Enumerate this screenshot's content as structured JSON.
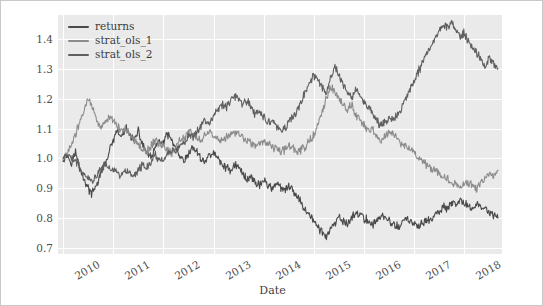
{
  "chart_data": {
    "type": "line",
    "title": "",
    "xlabel": "Date",
    "ylabel": "",
    "grid": true,
    "legend_position": "upper-left",
    "xlim": [
      2009.9,
      2018.75
    ],
    "ylim": [
      0.68,
      1.48
    ],
    "yticks": [
      "1.4",
      "1.3",
      "1.2",
      "1.1",
      "1.0",
      "0.9",
      "0.8",
      "0.7"
    ],
    "ytick_values": [
      1.4,
      1.3,
      1.2,
      1.1,
      1.0,
      0.9,
      0.8,
      0.7
    ],
    "xticks": [
      "2010",
      "2011",
      "2012",
      "2013",
      "2014",
      "2015",
      "2016",
      "2017",
      "2018"
    ],
    "xtick_values": [
      2010,
      2011,
      2012,
      2013,
      2014,
      2015,
      2016,
      2017,
      2018
    ],
    "colors": {
      "returns": "#4a4a4a",
      "strat_ols_1": "#8c8c8c",
      "strat_ols_2": "#5f5f5f",
      "plot_background": "#eaeaea",
      "gridline": "#ffffff",
      "figure_background": "#ffffff",
      "figure_border": "#c9c9c9",
      "tick_text": "#4d4d4d"
    },
    "x": [
      2010.0,
      2010.08,
      2010.17,
      2010.25,
      2010.33,
      2010.42,
      2010.5,
      2010.58,
      2010.67,
      2010.75,
      2010.83,
      2010.92,
      2011.0,
      2011.08,
      2011.17,
      2011.25,
      2011.33,
      2011.42,
      2011.5,
      2011.58,
      2011.67,
      2011.75,
      2011.83,
      2011.92,
      2012.0,
      2012.08,
      2012.17,
      2012.25,
      2012.33,
      2012.42,
      2012.5,
      2012.58,
      2012.67,
      2012.75,
      2012.83,
      2012.92,
      2013.0,
      2013.08,
      2013.17,
      2013.25,
      2013.33,
      2013.42,
      2013.5,
      2013.58,
      2013.67,
      2013.75,
      2013.83,
      2013.92,
      2014.0,
      2014.08,
      2014.17,
      2014.25,
      2014.33,
      2014.42,
      2014.5,
      2014.58,
      2014.67,
      2014.75,
      2014.83,
      2014.92,
      2015.0,
      2015.08,
      2015.17,
      2015.25,
      2015.33,
      2015.42,
      2015.5,
      2015.58,
      2015.67,
      2015.75,
      2015.83,
      2015.92,
      2016.0,
      2016.08,
      2016.17,
      2016.25,
      2016.33,
      2016.42,
      2016.5,
      2016.58,
      2016.67,
      2016.75,
      2016.83,
      2016.92,
      2017.0,
      2017.08,
      2017.17,
      2017.25,
      2017.33,
      2017.42,
      2017.5,
      2017.58,
      2017.67,
      2017.75,
      2017.83,
      2017.92,
      2018.0,
      2018.08,
      2018.17,
      2018.25,
      2018.33,
      2018.42,
      2018.5,
      2018.58,
      2018.67
    ],
    "series": [
      {
        "name": "returns",
        "color": "#4a4a4a",
        "values": [
          1.0,
          1.01,
          0.99,
          1.02,
          0.97,
          0.93,
          0.9,
          0.88,
          0.91,
          0.95,
          0.98,
          1.02,
          1.06,
          1.09,
          1.07,
          1.1,
          1.08,
          1.06,
          1.09,
          1.05,
          1.02,
          1.0,
          1.03,
          1.06,
          1.05,
          1.08,
          1.06,
          1.03,
          1.0,
          0.99,
          1.01,
          1.04,
          1.02,
          1.0,
          0.99,
          1.01,
          1.02,
          1.0,
          0.98,
          0.97,
          0.96,
          0.98,
          0.97,
          0.95,
          0.93,
          0.94,
          0.92,
          0.91,
          0.93,
          0.91,
          0.9,
          0.92,
          0.9,
          0.89,
          0.91,
          0.89,
          0.87,
          0.85,
          0.83,
          0.81,
          0.79,
          0.77,
          0.75,
          0.74,
          0.76,
          0.78,
          0.8,
          0.79,
          0.78,
          0.8,
          0.82,
          0.81,
          0.8,
          0.79,
          0.78,
          0.79,
          0.81,
          0.8,
          0.79,
          0.78,
          0.77,
          0.78,
          0.8,
          0.79,
          0.78,
          0.77,
          0.78,
          0.8,
          0.79,
          0.81,
          0.82,
          0.84,
          0.83,
          0.85,
          0.84,
          0.86,
          0.85,
          0.84,
          0.83,
          0.85,
          0.84,
          0.83,
          0.82,
          0.81,
          0.8
        ]
      },
      {
        "name": "strat_ols_1",
        "color": "#8c8c8c",
        "values": [
          1.0,
          1.02,
          1.05,
          1.08,
          1.12,
          1.16,
          1.2,
          1.17,
          1.13,
          1.1,
          1.12,
          1.14,
          1.13,
          1.11,
          1.09,
          1.1,
          1.08,
          1.06,
          1.05,
          1.03,
          1.02,
          1.04,
          1.06,
          1.05,
          1.04,
          1.03,
          1.02,
          1.04,
          1.06,
          1.07,
          1.09,
          1.08,
          1.07,
          1.06,
          1.08,
          1.09,
          1.08,
          1.07,
          1.06,
          1.07,
          1.08,
          1.09,
          1.08,
          1.07,
          1.06,
          1.05,
          1.04,
          1.05,
          1.06,
          1.05,
          1.04,
          1.03,
          1.02,
          1.03,
          1.04,
          1.03,
          1.02,
          1.03,
          1.04,
          1.06,
          1.08,
          1.12,
          1.16,
          1.2,
          1.24,
          1.22,
          1.2,
          1.18,
          1.16,
          1.18,
          1.15,
          1.13,
          1.11,
          1.09,
          1.1,
          1.08,
          1.06,
          1.07,
          1.09,
          1.08,
          1.06,
          1.05,
          1.04,
          1.03,
          1.02,
          1.0,
          0.99,
          0.98,
          0.97,
          0.96,
          0.95,
          0.94,
          0.93,
          0.92,
          0.91,
          0.9,
          0.91,
          0.92,
          0.91,
          0.9,
          0.92,
          0.93,
          0.95,
          0.94,
          0.96
        ]
      },
      {
        "name": "strat_ols_2",
        "color": "#5f5f5f",
        "values": [
          1.0,
          1.01,
          1.0,
          0.99,
          0.97,
          0.95,
          0.93,
          0.92,
          0.94,
          0.96,
          0.98,
          0.97,
          0.96,
          0.95,
          0.94,
          0.96,
          0.95,
          0.94,
          0.96,
          0.98,
          0.97,
          0.99,
          1.01,
          1.0,
          0.99,
          1.01,
          1.03,
          1.02,
          1.04,
          1.06,
          1.08,
          1.07,
          1.09,
          1.11,
          1.13,
          1.12,
          1.14,
          1.16,
          1.18,
          1.17,
          1.19,
          1.21,
          1.2,
          1.18,
          1.19,
          1.17,
          1.15,
          1.16,
          1.14,
          1.12,
          1.13,
          1.11,
          1.09,
          1.1,
          1.12,
          1.14,
          1.16,
          1.19,
          1.22,
          1.25,
          1.28,
          1.26,
          1.24,
          1.22,
          1.26,
          1.31,
          1.28,
          1.25,
          1.22,
          1.2,
          1.23,
          1.21,
          1.19,
          1.17,
          1.15,
          1.13,
          1.11,
          1.12,
          1.14,
          1.13,
          1.15,
          1.17,
          1.2,
          1.23,
          1.26,
          1.29,
          1.32,
          1.35,
          1.38,
          1.41,
          1.43,
          1.45,
          1.44,
          1.46,
          1.43,
          1.41,
          1.42,
          1.39,
          1.37,
          1.35,
          1.33,
          1.31,
          1.34,
          1.32,
          1.3
        ]
      }
    ]
  },
  "legend": {
    "items": [
      {
        "label": "returns"
      },
      {
        "label": "strat_ols_1"
      },
      {
        "label": "strat_ols_2"
      }
    ]
  }
}
